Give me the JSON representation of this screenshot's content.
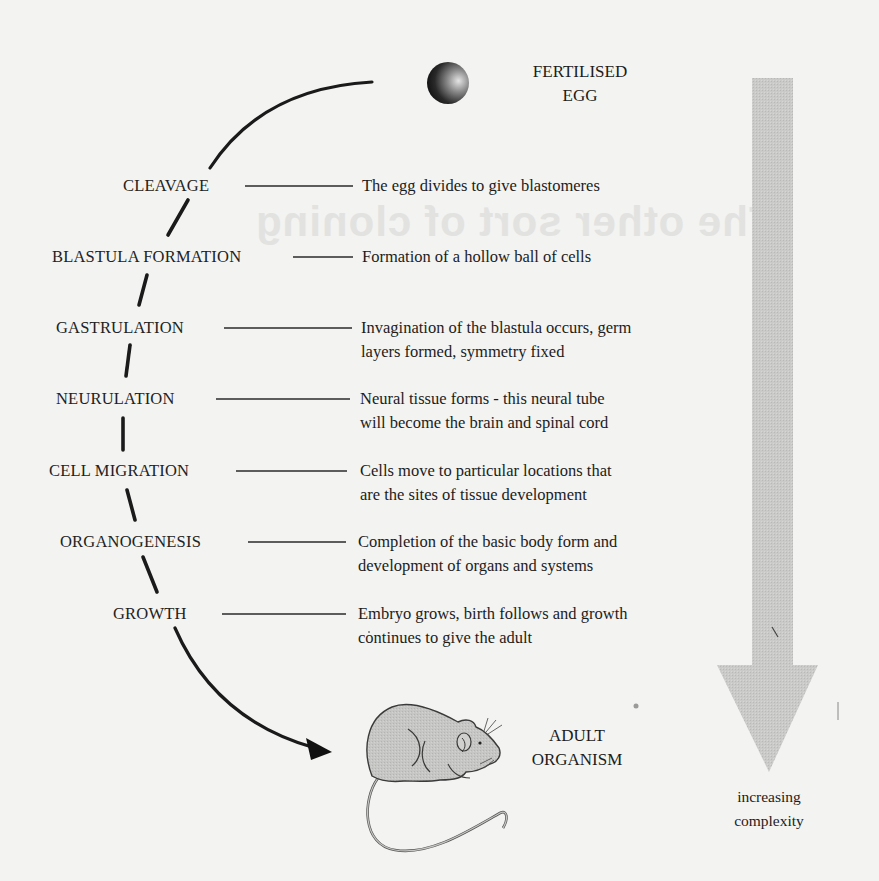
{
  "diagram": {
    "start": {
      "label_lines": [
        "FERTILISED",
        "EGG"
      ],
      "icon": "egg-icon"
    },
    "end": {
      "label_lines": [
        "ADULT",
        "ORGANISM"
      ],
      "icon": "mouse-icon"
    },
    "stages": [
      {
        "name": "CLEAVAGE",
        "description_lines": [
          "The egg divides to give blastomeres"
        ]
      },
      {
        "name": "BLASTULA FORMATION",
        "description_lines": [
          "Formation of a hollow ball of cells"
        ]
      },
      {
        "name": "GASTRULATION",
        "description_lines": [
          "Invagination of the blastula occurs, germ",
          "layers formed, symmetry fixed"
        ]
      },
      {
        "name": "NEURULATION",
        "description_lines": [
          "Neural tissue forms - this neural tube",
          "will become the brain and spinal cord"
        ]
      },
      {
        "name": "CELL MIGRATION",
        "description_lines": [
          "Cells move to particular locations that",
          "are the sites of tissue development"
        ]
      },
      {
        "name": "ORGANOGENESIS",
        "description_lines": [
          "Completion of the basic body form and",
          "development of organs and systems"
        ]
      },
      {
        "name": "GROWTH",
        "description_lines": [
          "Embryo grows, birth follows and growth",
          "continues to give the adult"
        ]
      }
    ],
    "complexity_arrow": {
      "label_lines": [
        "increasing",
        "complexity"
      ],
      "direction": "down",
      "color": "#c9c9c7"
    },
    "colors": {
      "background": "#f3f3f1",
      "ink": "#1e1e1e",
      "arrow_fill": "#c9c9c7",
      "mouse_fill": "#c4c4c2",
      "egg_dark": "#1a1a1a",
      "egg_light": "#e0e0e0"
    }
  },
  "background_bleed": {
    "title": "The other sort of cloning"
  }
}
